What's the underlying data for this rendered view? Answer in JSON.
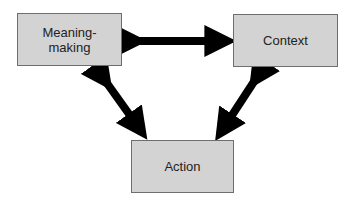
{
  "diagram": {
    "nodes": [
      {
        "id": "meaning-making",
        "label_line1": "Meaning-",
        "label_line2": "making"
      },
      {
        "id": "context",
        "label": "Context"
      },
      {
        "id": "action",
        "label": "Action"
      }
    ],
    "edges": [
      {
        "from": "meaning-making",
        "to": "context",
        "type": "bidirectional"
      },
      {
        "from": "meaning-making",
        "to": "action",
        "type": "bidirectional"
      },
      {
        "from": "context",
        "to": "action",
        "type": "bidirectional"
      }
    ],
    "colors": {
      "box_fill": "#d3d3d3",
      "box_border": "#6e6e6e",
      "arrow": "#000000"
    }
  }
}
